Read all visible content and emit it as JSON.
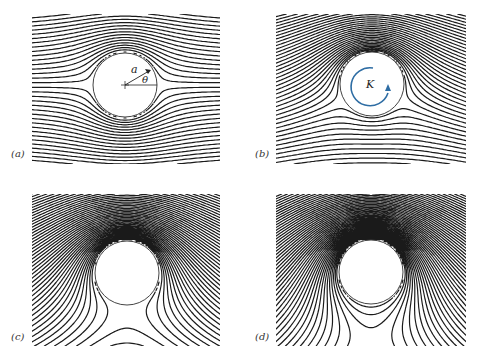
{
  "figure": {
    "panels": [
      {
        "id": "a",
        "label": "(a)",
        "circulation": 0,
        "annotations": {
          "radius_label": "a",
          "angle_label": "θ",
          "center_mark": "+"
        },
        "box": {
          "x": 32,
          "y": 14,
          "w": 188,
          "h": 150
        },
        "cylinder": {
          "cx": 125,
          "cy": 85,
          "r": 32
        }
      },
      {
        "id": "b",
        "label": "(b)",
        "circulation": 1.0,
        "annotations": {
          "circulation_label": "K",
          "arrow_color": "#2e6da4",
          "arrow_direction": "counterclockwise"
        },
        "box": {
          "x": 276,
          "y": 14,
          "w": 190,
          "h": 150
        },
        "cylinder": {
          "cx": 372,
          "cy": 84,
          "r": 32
        }
      },
      {
        "id": "c",
        "label": "(c)",
        "circulation": 2.0,
        "annotations": {},
        "box": {
          "x": 32,
          "y": 194,
          "w": 188,
          "h": 152
        },
        "cylinder": {
          "cx": 127,
          "cy": 273,
          "r": 32
        }
      },
      {
        "id": "d",
        "label": "(d)",
        "circulation": 2.6,
        "annotations": {},
        "box": {
          "x": 276,
          "y": 194,
          "w": 190,
          "h": 152
        },
        "cylinder": {
          "cx": 371,
          "cy": 272,
          "r": 32
        }
      }
    ],
    "colors": {
      "streamline": "#1a1a1a",
      "cylinder": "#444444",
      "arrow": "#2e6da4",
      "label": "#333333"
    }
  }
}
